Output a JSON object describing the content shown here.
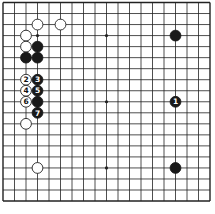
{
  "diagram": {
    "type": "go-board",
    "board_size": 19,
    "grid": {
      "origin_x": 3,
      "origin_y": 2.5,
      "spacing_x": 11.5,
      "spacing_y": 11.03,
      "line_color": "#222222",
      "background": "#ffffff"
    },
    "star_points": [
      [
        3,
        3
      ],
      [
        9,
        3
      ],
      [
        15,
        3
      ],
      [
        3,
        9
      ],
      [
        9,
        9
      ],
      [
        15,
        9
      ],
      [
        3,
        15
      ],
      [
        9,
        15
      ],
      [
        15,
        15
      ]
    ],
    "stones": [
      {
        "color": "white",
        "col": 3,
        "row": 2,
        "label": ""
      },
      {
        "color": "white",
        "col": 5,
        "row": 2,
        "label": ""
      },
      {
        "color": "white",
        "col": 2,
        "row": 3,
        "label": ""
      },
      {
        "color": "white",
        "col": 2,
        "row": 4,
        "label": ""
      },
      {
        "color": "black",
        "col": 3,
        "row": 4,
        "label": ""
      },
      {
        "color": "black",
        "col": 2,
        "row": 5,
        "label": ""
      },
      {
        "color": "black",
        "col": 3,
        "row": 5,
        "label": ""
      },
      {
        "color": "white",
        "col": 2,
        "row": 7,
        "label": "2"
      },
      {
        "color": "black",
        "col": 3,
        "row": 7,
        "label": "3"
      },
      {
        "color": "white",
        "col": 2,
        "row": 8,
        "label": "4"
      },
      {
        "color": "black",
        "col": 3,
        "row": 8,
        "label": "5"
      },
      {
        "color": "white",
        "col": 2,
        "row": 9,
        "label": "6"
      },
      {
        "color": "black",
        "col": 3,
        "row": 9,
        "label": ""
      },
      {
        "color": "black",
        "col": 3,
        "row": 10,
        "label": "7"
      },
      {
        "color": "white",
        "col": 2,
        "row": 11,
        "label": ""
      },
      {
        "color": "white",
        "col": 3,
        "row": 15,
        "label": ""
      },
      {
        "color": "black",
        "col": 15,
        "row": 3,
        "label": ""
      },
      {
        "color": "black",
        "col": 15,
        "row": 9,
        "label": "1"
      },
      {
        "color": "black",
        "col": 15,
        "row": 15,
        "label": ""
      }
    ]
  }
}
